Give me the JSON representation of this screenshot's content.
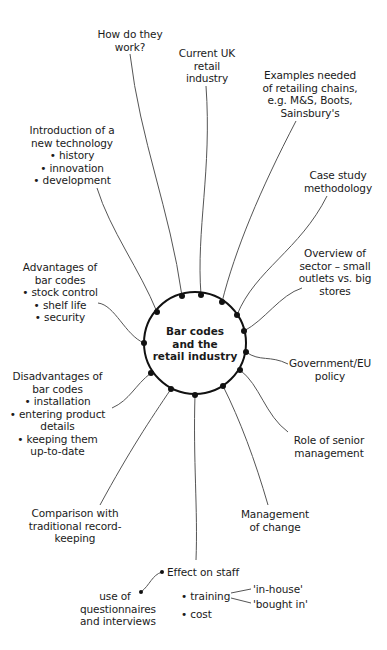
{
  "diagram": {
    "type": "mind-map",
    "central_topic": {
      "lines": [
        "Bar codes",
        "and the",
        "retail industry"
      ]
    },
    "branches": [
      {
        "id": "how-work",
        "lines": [
          "How do they",
          "work?"
        ]
      },
      {
        "id": "current-uk",
        "lines": [
          "Current UK",
          "retail",
          "industry"
        ]
      },
      {
        "id": "examples",
        "lines": [
          "Examples needed",
          "of retailing chains,",
          "e.g. M&S, Boots,",
          "Sainsbury's"
        ]
      },
      {
        "id": "case-study",
        "lines": [
          "Case study",
          "methodology"
        ]
      },
      {
        "id": "overview",
        "lines": [
          "Overview of",
          "sector – small",
          "outlets vs. big",
          "stores"
        ]
      },
      {
        "id": "government",
        "lines": [
          "Government/EU",
          "policy"
        ]
      },
      {
        "id": "senior-mgmt",
        "lines": [
          "Role of senior",
          "management"
        ]
      },
      {
        "id": "change-mgmt",
        "lines": [
          "Management",
          "of change"
        ]
      },
      {
        "id": "effect-staff",
        "lines": [
          "Effect on staff"
        ]
      },
      {
        "id": "comparison",
        "lines": [
          "Comparison with",
          "traditional record-",
          "keeping"
        ]
      },
      {
        "id": "disadvantages",
        "lines": [
          "Disadvantages of",
          "bar codes",
          "• installation",
          "• entering product",
          "details",
          "• keeping them",
          "up-to-date"
        ]
      },
      {
        "id": "advantages",
        "lines": [
          "Advantages of",
          "bar codes",
          "• stock control",
          "• shelf life",
          "• security"
        ]
      },
      {
        "id": "introduction",
        "lines": [
          "Introduction of a",
          "new technology",
          "• history",
          "• innovation",
          "• development"
        ]
      }
    ],
    "sub_branches": {
      "effect_on_staff": {
        "questionnaires": {
          "lines": [
            "use of",
            "questionnaires",
            "and interviews"
          ]
        },
        "training": "• training",
        "cost": "• cost",
        "training_options": [
          "'in-house'",
          "'bought in'"
        ]
      }
    }
  }
}
